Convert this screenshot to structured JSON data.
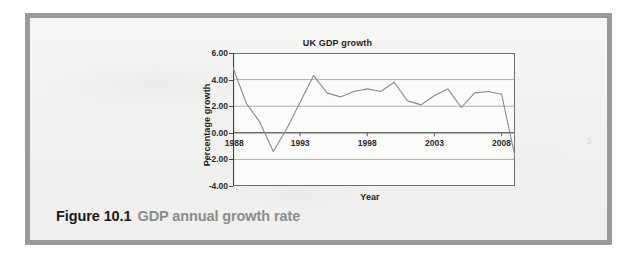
{
  "figure": {
    "caption_number": "Figure 10.1",
    "caption_text": "GDP annual growth rate",
    "corner_mark": "3",
    "frame_color": "#9a9a9a",
    "page_background": "#f4f4f2"
  },
  "chart_data": {
    "type": "line",
    "title": "UK GDP growth",
    "xlabel": "Year",
    "ylabel": "Percentage growth",
    "grid": true,
    "legend": null,
    "line_color": "#8a8a8a",
    "xlim": [
      1988,
      2009
    ],
    "ylim": [
      -4.0,
      6.0
    ],
    "ytick_labels": [
      "6.00",
      "4.00",
      "2.00",
      "0.00",
      "-2.00",
      "-4.00"
    ],
    "yticks": [
      6,
      4,
      2,
      0,
      -2,
      -4
    ],
    "xtick_labels": [
      "1988",
      "1993",
      "1998",
      "2003",
      "2008"
    ],
    "xticks": [
      1988,
      1993,
      1998,
      2003,
      2008
    ],
    "x": [
      1988,
      1989,
      1990,
      1991,
      1992,
      1993,
      1994,
      1995,
      1996,
      1997,
      1998,
      1999,
      2000,
      2001,
      2002,
      2003,
      2004,
      2005,
      2006,
      2007,
      2008,
      2009
    ],
    "values": [
      4.9,
      2.2,
      0.8,
      -1.4,
      0.3,
      2.3,
      4.3,
      3.0,
      2.7,
      3.1,
      3.3,
      3.1,
      3.8,
      2.4,
      2.1,
      2.8,
      3.3,
      1.9,
      3.0,
      3.1,
      2.9,
      -1.8
    ],
    "series": [
      {
        "name": "UK GDP growth",
        "values": [
          4.9,
          2.2,
          0.8,
          -1.4,
          0.3,
          2.3,
          4.3,
          3.0,
          2.7,
          3.1,
          3.3,
          3.1,
          3.8,
          2.4,
          2.1,
          2.8,
          3.3,
          1.9,
          3.0,
          3.1,
          2.9,
          -1.8
        ]
      }
    ]
  }
}
